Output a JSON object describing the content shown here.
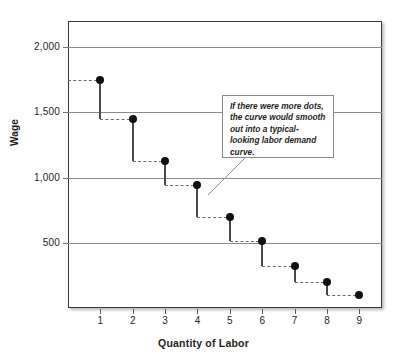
{
  "chart_data": {
    "type": "scatter",
    "title": "",
    "xlabel": "Quantity of Labor",
    "ylabel": "Wage",
    "x": [
      1,
      2,
      3,
      4,
      5,
      6,
      7,
      8,
      9
    ],
    "values": [
      1750,
      1450,
      1125,
      940,
      700,
      515,
      325,
      200,
      100
    ],
    "categories": [
      "1",
      "2",
      "3",
      "4",
      "5",
      "6",
      "7",
      "8",
      "9"
    ],
    "series": [
      {
        "name": "Labor demand (marginal revenue product)",
        "values": [
          1750,
          1450,
          1125,
          940,
          700,
          515,
          325,
          200,
          100
        ]
      }
    ],
    "xlim": [
      0,
      9.7
    ],
    "ylim": [
      0,
      2200
    ],
    "x_ticks": [
      1,
      2,
      3,
      4,
      5,
      6,
      7,
      8,
      9
    ],
    "y_ticks": [
      500,
      1000,
      1500,
      2000
    ],
    "y_tick_labels": [
      "500",
      "1,000",
      "1,500",
      "2,000"
    ],
    "grid": true,
    "grid_axis": "y",
    "legend": false,
    "legend_position": "none",
    "marker": "filled-circle",
    "step_style": "descending-step-with-dashed-risers",
    "annotations": [
      {
        "text": "If there were more dots, the curve would smooth out into a typical-looking labor demand curve.",
        "style": "boxed-callout-with-leader-line",
        "points_to": {
          "x": 4.5,
          "y": 960
        }
      }
    ]
  },
  "axes": {
    "y": {
      "title": "Wage",
      "ticks": [
        {
          "label": "2,000",
          "value": 2000
        },
        {
          "label": "1,500",
          "value": 1500
        },
        {
          "label": "1,000",
          "value": 1000
        },
        {
          "label": "500",
          "value": 500
        }
      ]
    },
    "x": {
      "title": "Quantity of Labor",
      "ticks": [
        {
          "label": "1",
          "value": 1
        },
        {
          "label": "2",
          "value": 2
        },
        {
          "label": "3",
          "value": 3
        },
        {
          "label": "4",
          "value": 4
        },
        {
          "label": "5",
          "value": 5
        },
        {
          "label": "6",
          "value": 6
        },
        {
          "label": "7",
          "value": 7
        },
        {
          "label": "8",
          "value": 8
        },
        {
          "label": "9",
          "value": 9
        }
      ]
    }
  },
  "callout": {
    "text": "If there were more dots, the curve would smooth out into a typical-looking labor demand curve."
  },
  "colors": {
    "marker": "#111111",
    "stem": "#4a4a4a",
    "riser": "#6b6b6b",
    "gridline": "#8c8c8c",
    "frame": "#3b3b3b",
    "text": "#231f20",
    "callout_border": "#8b8b8b",
    "background": "#ffffff"
  }
}
